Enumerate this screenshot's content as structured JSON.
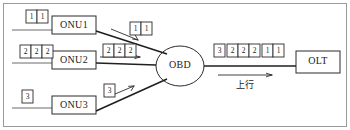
{
  "diagram": {
    "nodes": [
      {
        "id": "onu1",
        "label": "ONU1"
      },
      {
        "id": "onu2",
        "label": "ONU2"
      },
      {
        "id": "onu3",
        "label": "ONU3"
      },
      {
        "id": "obd",
        "label": "OBD"
      },
      {
        "id": "olt",
        "label": "OLT"
      }
    ],
    "direction_label": "上行",
    "cell_groups": {
      "onu1_queue": [
        "1",
        "1"
      ],
      "onu2_queue": [
        "2",
        "2",
        "2"
      ],
      "onu3_queue": [
        "3"
      ],
      "onu1_uplink": [
        "1",
        "1"
      ],
      "onu2_uplink": [
        "2",
        "2",
        "2"
      ],
      "onu3_uplink": [
        "3"
      ],
      "trunk_stream": [
        "3",
        "2",
        "2",
        "2",
        "1",
        "1"
      ]
    }
  },
  "colors": {
    "stroke": "#2b2b2b",
    "trunk": "#1f1f1f",
    "feeder": "#6b6b6b",
    "frame": "#9a9a9a",
    "background": "#ffffff"
  }
}
